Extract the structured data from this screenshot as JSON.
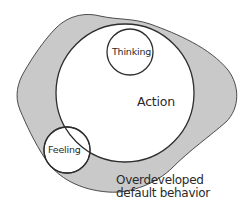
{
  "diagram": {
    "type": "nested-circles",
    "colors": {
      "background": "#ffffff",
      "blob_fill": "#c9c9c9",
      "stroke": "#3a3a3a",
      "circle_fill": "#ffffff",
      "text": "#2a2a2a"
    },
    "shapes": {
      "blob": {
        "name": "Overdeveloped default behavior region"
      },
      "action_circle": {
        "cx": 125,
        "cy": 93,
        "r": 69
      },
      "thinking_circle": {
        "cx": 130,
        "cy": 52,
        "r": 23
      },
      "feeling_circle": {
        "cx": 67,
        "cy": 150,
        "r": 23
      }
    },
    "labels": {
      "thinking": "Thinking",
      "action": "Action",
      "feeling": "Feeling",
      "caption_line1": "Overdeveloped",
      "caption_line2": "default behavior"
    }
  }
}
